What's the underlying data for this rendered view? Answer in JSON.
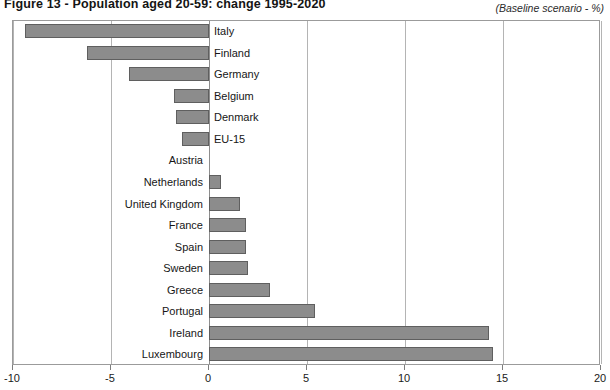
{
  "chart_data": {
    "type": "bar",
    "orientation": "horizontal",
    "title": "Figure 13 - Population aged 20-59: change 1995-2020",
    "subtitle": "(Baseline scenario - %)",
    "xlabel": "",
    "ylabel": "",
    "xlim": [
      -10,
      20
    ],
    "xticks": [
      -10,
      -5,
      0,
      5,
      10,
      15,
      20
    ],
    "xtick_labels": [
      "-10",
      "-5",
      "0",
      "5",
      "10",
      "15",
      "20"
    ],
    "grid": true,
    "grid_axis": "x",
    "legend": false,
    "bar_color": "#8c8c8c",
    "bar_edge_color": "#5f5f5f",
    "categories": [
      "Italy",
      "Finland",
      "Germany",
      "Belgium",
      "Denmark",
      "EU-15",
      "Austria",
      "Netherlands",
      "United Kingdom",
      "France",
      "Spain",
      "Sweden",
      "Greece",
      "Portugal",
      "Ireland",
      "Luxembourg"
    ],
    "values": [
      -9.4,
      -6.2,
      -4.1,
      -1.8,
      -1.7,
      -1.4,
      0.0,
      0.6,
      1.6,
      1.9,
      1.9,
      2.0,
      3.1,
      5.4,
      14.3,
      14.5
    ]
  }
}
